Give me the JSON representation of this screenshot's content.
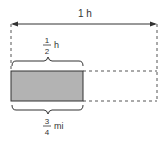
{
  "diagram": {
    "total_time_label": {
      "value": "1",
      "unit": "h"
    },
    "half_time_label": {
      "numerator": "1",
      "denominator": "2",
      "unit": "h"
    },
    "distance_label": {
      "numerator": "3",
      "denominator": "4",
      "unit": "mi"
    },
    "colors": {
      "shaded_fill": "#b3b3b3",
      "line": "#333333",
      "dashed": "#555555"
    }
  }
}
